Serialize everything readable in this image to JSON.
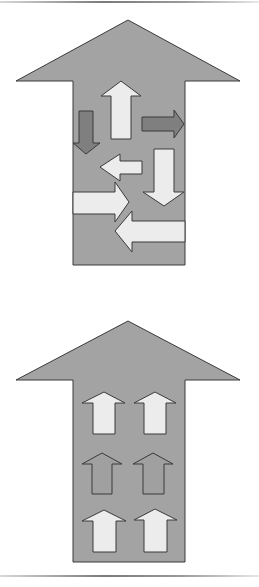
{
  "colors": {
    "big_arrow_fill": "#a3a3a3",
    "outline": "#3a3a3a",
    "light_arrow": "#ececec",
    "dark_arrow": "#7f7f7f",
    "background": "#ffffff"
  },
  "diagrams": [
    {
      "id": "chaotic",
      "description": "Large upward arrow containing small arrows pointing in mixed directions",
      "inner_arrows": [
        {
          "direction": "up",
          "shade": "light"
        },
        {
          "direction": "down",
          "shade": "dark"
        },
        {
          "direction": "right",
          "shade": "dark"
        },
        {
          "direction": "left",
          "shade": "light"
        },
        {
          "direction": "down",
          "shade": "light"
        },
        {
          "direction": "right",
          "shade": "light"
        },
        {
          "direction": "left",
          "shade": "light"
        }
      ]
    },
    {
      "id": "aligned",
      "description": "Large upward arrow containing six small arrows all pointing up",
      "inner_arrows": [
        {
          "direction": "up",
          "shade": "light"
        },
        {
          "direction": "up",
          "shade": "light"
        },
        {
          "direction": "up",
          "shade": "medium"
        },
        {
          "direction": "up",
          "shade": "medium"
        },
        {
          "direction": "up",
          "shade": "light"
        },
        {
          "direction": "up",
          "shade": "light"
        }
      ]
    }
  ]
}
